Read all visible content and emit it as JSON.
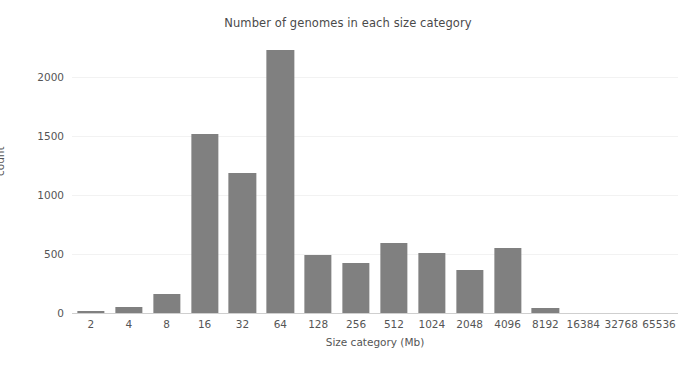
{
  "chart_data": {
    "type": "bar",
    "title": "Number of genomes in each size category",
    "xlabel": "Size category (Mb)",
    "ylabel": "count",
    "categories": [
      "2",
      "4",
      "8",
      "16",
      "32",
      "64",
      "128",
      "256",
      "512",
      "1024",
      "2048",
      "4096",
      "8192",
      "16384",
      "32768",
      "65536"
    ],
    "values": [
      15,
      50,
      160,
      1520,
      1185,
      2230,
      495,
      425,
      590,
      510,
      365,
      555,
      40,
      0,
      0,
      0
    ],
    "ylim": [
      0,
      2330
    ],
    "yticks": [
      "0",
      "500",
      "1000",
      "1500",
      "2000"
    ],
    "ytick_values": [
      0,
      500,
      1000,
      1500,
      2000
    ],
    "grid": "horizontal",
    "legend": "none",
    "bar_color": "#808080",
    "background_color": "#ffffff",
    "gridline_color": "#f2f2f2"
  }
}
